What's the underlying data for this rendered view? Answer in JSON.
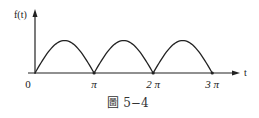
{
  "chart_data": {
    "type": "line",
    "title": "",
    "function": "|sin t|",
    "x": [
      0,
      0.5236,
      1.0472,
      1.5708,
      2.0944,
      2.618,
      3.1416,
      3.6652,
      4.1888,
      4.7124,
      5.236,
      5.7596,
      6.2832,
      6.8068,
      7.3304,
      7.854,
      8.3776,
      8.9012,
      9.4248
    ],
    "y": [
      0,
      0.5,
      0.866,
      1,
      0.866,
      0.5,
      0,
      0.5,
      0.866,
      1,
      0.866,
      0.5,
      0,
      0.5,
      0.866,
      1,
      0.866,
      0.5,
      0
    ],
    "xlabel": "t",
    "ylabel": "f(t)",
    "xlim": [
      0,
      10.9
    ],
    "ylim": [
      0,
      1.85
    ],
    "xticks": [
      {
        "value": 0,
        "label": "0"
      },
      {
        "value": 3.1416,
        "label": "π"
      },
      {
        "value": 6.2832,
        "label": "2 π"
      },
      {
        "value": 9.4248,
        "label": "3 π"
      }
    ],
    "grid": false,
    "legend": "none",
    "caption": "圖 5−4"
  }
}
